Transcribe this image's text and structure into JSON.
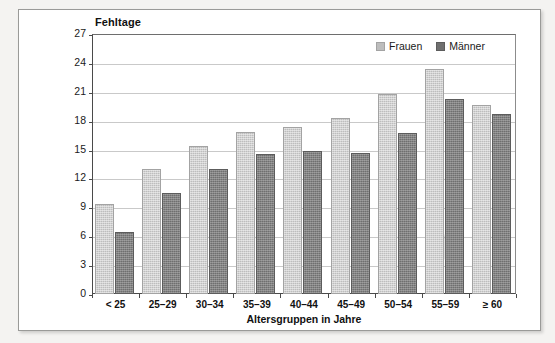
{
  "chart_data": {
    "type": "bar",
    "title": "",
    "ylabel": "Fehltage",
    "xlabel": "Altersgruppen in Jahre",
    "categories": [
      "< 25",
      "25–29",
      "30–34",
      "35–39",
      "40–44",
      "45–49",
      "50–54",
      "55–59",
      "≥ 60"
    ],
    "series": [
      {
        "name": "Frauen",
        "color": "#bdbdbd",
        "values": [
          9.3,
          13.0,
          15.4,
          16.8,
          17.3,
          18.3,
          20.8,
          23.4,
          19.6
        ]
      },
      {
        "name": "Männer",
        "color": "#6f6f6f",
        "values": [
          6.4,
          10.5,
          13.0,
          14.5,
          14.8,
          14.6,
          16.7,
          20.3,
          18.7
        ]
      }
    ],
    "ylim": [
      0,
      27
    ],
    "yticks": [
      27,
      24,
      21,
      18,
      15,
      12,
      9,
      6,
      3,
      0
    ],
    "ytick_labels": [
      "27",
      "24",
      "21",
      "18",
      "15",
      "12",
      "9",
      "6",
      "3",
      "0"
    ],
    "grid": true,
    "legend_position": "top-right"
  },
  "legend": {
    "items": [
      {
        "label": "Frauen",
        "swatch": "frauen-swatch"
      },
      {
        "label": "Männer",
        "swatch": "maenner-swatch"
      }
    ]
  }
}
